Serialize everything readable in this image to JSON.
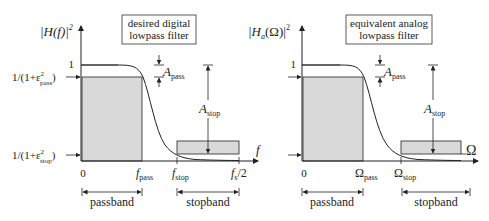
{
  "left_plot": {
    "title_line1": "desired digital",
    "title_line2": "lowpass filter",
    "y_label_main": "|H(f)|",
    "y_label_sup": "2",
    "y_tick_one": "1",
    "y_tick_pass_pre": "1/(1+ε",
    "y_tick_pass_sup": "2",
    "y_tick_pass_sub": "pass",
    "y_tick_pass_post": ")",
    "y_tick_stop_pre": "1/(1+ε",
    "y_tick_stop_sup": "2",
    "y_tick_stop_sub": "stop",
    "y_tick_stop_post": ")",
    "x_axis_label": "f",
    "x_tick_zero": "0",
    "x_tick_pass_main": "f",
    "x_tick_pass_sub": "pass",
    "x_tick_stop_main": "f",
    "x_tick_stop_sub": "stop",
    "x_tick_nyq_main": "f",
    "x_tick_nyq_sub": "s",
    "x_tick_nyq_post": "/2",
    "a_pass_main": "A",
    "a_pass_sub": "pass",
    "a_stop_main": "A",
    "a_stop_sub": "stop",
    "band_passband": "passband",
    "band_stopband": "stopband"
  },
  "right_plot": {
    "title_line1": "equivalent analog",
    "title_line2": "lowpass filter",
    "y_label_main": "|H",
    "y_label_sub": "a",
    "y_label_post": "(Ω)|",
    "y_label_sup": "2",
    "y_tick_one": "1",
    "x_axis_label": "Ω",
    "x_tick_zero": "0",
    "x_tick_pass_main": "Ω",
    "x_tick_pass_sub": "pass",
    "x_tick_stop_main": "Ω",
    "x_tick_stop_sub": "stop",
    "a_pass_main": "A",
    "a_pass_sub": "pass",
    "a_stop_main": "A",
    "a_stop_sub": "stop",
    "band_passband": "passband",
    "band_stopband": "stopband"
  },
  "colors": {
    "shade": "#d9d9d9",
    "line": "#222222"
  }
}
